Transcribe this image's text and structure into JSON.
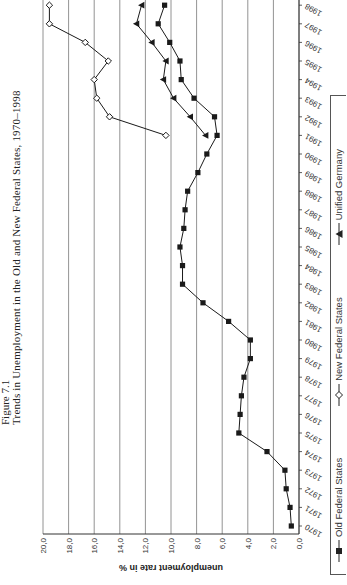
{
  "figure_label": "Figure 7.1",
  "title": "Trends in Unemployment in the Old and New Federal States, 1970–1998",
  "chart_data": {
    "type": "line",
    "title": "Trends in Unemployment in the Old and New Federal States, 1970–1998",
    "xlabel": "",
    "ylabel": "unemployment rate in %",
    "ylim": [
      0,
      20
    ],
    "yticks": [
      "0,0",
      "2,0",
      "4,0",
      "6,0",
      "8,0",
      "10,0",
      "12,0",
      "14,0",
      "16,0",
      "18,0",
      "20,0"
    ],
    "grid": true,
    "legend_position": "bottom",
    "orientation": "rotated 90 degrees counter-clockwise on page",
    "x": [
      1970,
      1971,
      1972,
      1973,
      1974,
      1975,
      1976,
      1977,
      1978,
      1979,
      1980,
      1981,
      1982,
      1983,
      1984,
      1985,
      1986,
      1987,
      1988,
      1989,
      1990,
      1991,
      1992,
      1993,
      1994,
      1995,
      1996,
      1997,
      1998
    ],
    "series": [
      {
        "name": "Old Federal States",
        "marker": "filled-square",
        "values": [
          0.6,
          0.7,
          1.0,
          1.1,
          2.5,
          4.7,
          4.6,
          4.5,
          4.3,
          3.8,
          3.8,
          5.5,
          7.5,
          9.1,
          9.1,
          9.3,
          9.0,
          8.9,
          8.7,
          7.9,
          7.2,
          6.4,
          6.6,
          8.2,
          9.2,
          9.3,
          10.1,
          11.0,
          10.5
        ]
      },
      {
        "name": "New Federal States",
        "marker": "open-diamond",
        "values": [
          null,
          null,
          null,
          null,
          null,
          null,
          null,
          null,
          null,
          null,
          null,
          null,
          null,
          null,
          null,
          null,
          null,
          null,
          null,
          null,
          null,
          10.4,
          14.8,
          15.8,
          16.0,
          14.9,
          16.7,
          19.5,
          19.5
        ]
      },
      {
        "name": "Unified Germany",
        "marker": "filled-triangle",
        "values": [
          null,
          null,
          null,
          null,
          null,
          null,
          null,
          null,
          null,
          null,
          null,
          null,
          null,
          null,
          null,
          null,
          null,
          null,
          null,
          null,
          null,
          7.3,
          8.5,
          9.8,
          10.6,
          10.4,
          11.5,
          12.7,
          12.3
        ]
      }
    ]
  },
  "legend": {
    "items": [
      {
        "label": "Old Federal States"
      },
      {
        "label": "New Federal States"
      },
      {
        "label": "Unified Germany"
      }
    ]
  }
}
